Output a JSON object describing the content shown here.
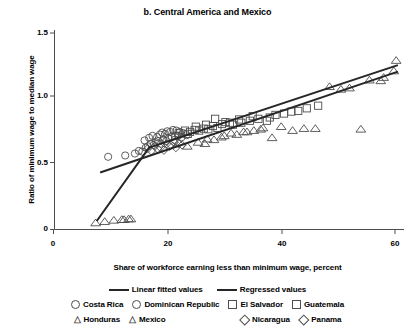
{
  "chart_data": {
    "type": "scatter",
    "title": "b. Central America and Mexico",
    "xlabel": "Share of workforce earning less than minimum wage, percent",
    "ylabel": "Ratio of minimum wage to median wage",
    "xlim": [
      0,
      62
    ],
    "ylim": [
      0,
      1.55
    ],
    "xticks": [
      0,
      20,
      40,
      60
    ],
    "xtick_labels": [
      "0",
      "20",
      "40",
      "60"
    ],
    "yticks": [
      0,
      0.5,
      1.0,
      1.5
    ],
    "ytick_labels": [
      "0",
      "0.5",
      "1.0",
      "1.5"
    ],
    "grid": false,
    "legend_position": "below-axes",
    "marker_color": "#4d4d4d",
    "line_color": "#262626",
    "series": [
      {
        "name": "Costa Rica",
        "marker": "circle",
        "points": [
          [
            9.6,
            0.555
          ],
          [
            12.6,
            0.565
          ],
          [
            14.3,
            0.58
          ],
          [
            15.0,
            0.6
          ],
          [
            15.6,
            0.595
          ],
          [
            16.2,
            0.625
          ],
          [
            16.6,
            0.635
          ],
          [
            17.1,
            0.655
          ],
          [
            17.6,
            0.645
          ],
          [
            18.0,
            0.665
          ],
          [
            18.4,
            0.675
          ],
          [
            18.9,
            0.655
          ],
          [
            19.3,
            0.685
          ],
          [
            19.8,
            0.675
          ],
          [
            20.2,
            0.695
          ],
          [
            20.8,
            0.705
          ],
          [
            21.3,
            0.685
          ],
          [
            21.9,
            0.715
          ],
          [
            22.5,
            0.705
          ]
        ]
      },
      {
        "name": "Dominican Republic",
        "marker": "circle",
        "points": [
          [
            16.0,
            0.68
          ],
          [
            16.8,
            0.7
          ],
          [
            17.4,
            0.715
          ],
          [
            18.2,
            0.705
          ],
          [
            18.7,
            0.725
          ],
          [
            19.1,
            0.74
          ],
          [
            19.6,
            0.73
          ],
          [
            20.0,
            0.75
          ],
          [
            20.5,
            0.745
          ],
          [
            21.0,
            0.76
          ],
          [
            21.6,
            0.755
          ],
          [
            22.2,
            0.745
          ],
          [
            22.8,
            0.735
          ],
          [
            23.4,
            0.72
          ]
        ]
      },
      {
        "name": "El Salvador",
        "marker": "square",
        "points": [
          [
            22.0,
            0.735
          ],
          [
            23.1,
            0.755
          ],
          [
            24.0,
            0.745
          ],
          [
            24.8,
            0.76
          ],
          [
            25.6,
            0.755
          ],
          [
            26.4,
            0.77
          ],
          [
            27.2,
            0.765
          ],
          [
            28.0,
            0.79
          ],
          [
            28.8,
            0.775
          ],
          [
            30.2,
            0.82
          ],
          [
            31.5,
            0.8
          ],
          [
            33.0,
            0.815
          ],
          [
            34.5,
            0.83
          ],
          [
            36.0,
            0.845
          ],
          [
            38.0,
            0.855
          ],
          [
            40.5,
            0.885
          ],
          [
            43.0,
            0.905
          ],
          [
            46.5,
            0.945
          ]
        ]
      },
      {
        "name": "Guatemala",
        "marker": "square",
        "points": [
          [
            21.4,
            0.715
          ],
          [
            23.6,
            0.73
          ],
          [
            25.0,
            0.785
          ],
          [
            26.8,
            0.8
          ],
          [
            28.4,
            0.845
          ],
          [
            29.6,
            0.805
          ],
          [
            31.0,
            0.815
          ],
          [
            32.6,
            0.84
          ],
          [
            35.0,
            0.865
          ],
          [
            37.5,
            0.83
          ],
          [
            39.0,
            0.875
          ],
          [
            41.8,
            0.9
          ],
          [
            44.5,
            0.925
          ]
        ]
      },
      {
        "name": "Honduras",
        "marker": "triangle",
        "points": [
          [
            7.4,
            0.05
          ],
          [
            9.0,
            0.06
          ],
          [
            10.6,
            0.07
          ],
          [
            12.4,
            0.075
          ],
          [
            13.6,
            0.08
          ],
          [
            27.0,
            0.69
          ],
          [
            29.5,
            0.705
          ],
          [
            31.2,
            0.735
          ],
          [
            33.4,
            0.745
          ],
          [
            35.2,
            0.755
          ],
          [
            36.8,
            0.775
          ],
          [
            38.4,
            0.7
          ],
          [
            40.0,
            0.785
          ],
          [
            44.0,
            0.77
          ],
          [
            48.5,
            1.09
          ],
          [
            52.0,
            1.08
          ],
          [
            55.5,
            1.14
          ],
          [
            58.0,
            1.16
          ],
          [
            60.2,
            1.29
          ]
        ]
      },
      {
        "name": "Mexico",
        "marker": "triangle",
        "points": [
          [
            12.0,
            0.075
          ],
          [
            13.2,
            0.08
          ],
          [
            23.5,
            0.635
          ],
          [
            25.4,
            0.665
          ],
          [
            26.6,
            0.655
          ],
          [
            28.2,
            0.685
          ],
          [
            30.0,
            0.715
          ],
          [
            32.2,
            0.725
          ],
          [
            34.0,
            0.745
          ],
          [
            36.4,
            0.765
          ],
          [
            42.0,
            0.755
          ],
          [
            46.0,
            0.77
          ],
          [
            50.5,
            1.07
          ],
          [
            54.0,
            0.765
          ],
          [
            57.5,
            1.135
          ],
          [
            59.8,
            1.21
          ]
        ]
      },
      {
        "name": "Nicaragua",
        "marker": "diamond",
        "points": [
          [
            16.5,
            0.615
          ],
          [
            17.8,
            0.635
          ],
          [
            18.8,
            0.625
          ],
          [
            19.9,
            0.655
          ],
          [
            20.6,
            0.645
          ],
          [
            21.2,
            0.665
          ],
          [
            22.0,
            0.655
          ]
        ]
      },
      {
        "name": "Panama",
        "marker": "diamond",
        "points": [
          [
            17.2,
            0.6
          ],
          [
            18.3,
            0.615
          ],
          [
            19.4,
            0.605
          ],
          [
            20.4,
            0.635
          ],
          [
            21.5,
            0.625
          ],
          [
            22.6,
            0.645
          ]
        ]
      }
    ],
    "lines": [
      {
        "name": "Linear fitted values",
        "label": "Linear fitted values",
        "points": [
          [
            8.2,
            0.435
          ],
          [
            60.5,
            1.205
          ]
        ]
      },
      {
        "name": "Regressed values",
        "label": "Regressed values",
        "points": [
          [
            7.6,
            0.065
          ],
          [
            16.8,
            0.625
          ],
          [
            60.5,
            1.255
          ]
        ]
      }
    ]
  },
  "legend": {
    "lines": [
      {
        "label": "Linear fitted values"
      },
      {
        "label": "Regressed values"
      }
    ],
    "row1": [
      {
        "label": "Costa Rica",
        "marker": "circle"
      },
      {
        "label": "Dominican Republic",
        "marker": "circle"
      },
      {
        "label": "El Salvador",
        "marker": "square"
      },
      {
        "label": "Guatemala",
        "marker": "square"
      }
    ],
    "row2": [
      {
        "label": "Honduras",
        "marker": "triangle"
      },
      {
        "label": "Mexico",
        "marker": "triangle"
      },
      {
        "label": "Nicaragua",
        "marker": "diamond"
      },
      {
        "label": "Panama",
        "marker": "diamond"
      }
    ]
  }
}
